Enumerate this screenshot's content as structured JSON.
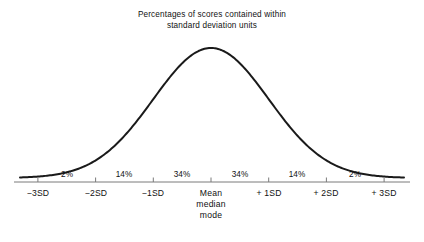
{
  "title": {
    "line1": "Percentages of scores contained within",
    "line2": "standard deviation units"
  },
  "chart_data": {
    "type": "line",
    "title": "Percentages of scores contained within standard deviation units",
    "xlabel": "",
    "ylabel": "",
    "curve": "normal-distribution-bell-curve",
    "grid": false,
    "legend": false,
    "xlim": [
      -3.5,
      3.5
    ],
    "categories": [
      "−3SD",
      "−2SD",
      "−1SD",
      "Mean median mode",
      "+ 1SD",
      "+ 2SD",
      "+ 3SD"
    ],
    "tick_labels": [
      {
        "id": "minus3sd",
        "text": "−3SD",
        "x_sd": -3
      },
      {
        "id": "minus2sd",
        "text": "−2SD",
        "x_sd": -2
      },
      {
        "id": "minus1sd",
        "text": "−1SD",
        "x_sd": -1
      },
      {
        "id": "mean",
        "text": "Mean\nmedian\nmode",
        "x_sd": 0
      },
      {
        "id": "plus1sd",
        "text": "+ 1SD",
        "x_sd": 1
      },
      {
        "id": "plus2sd",
        "text": "+ 2SD",
        "x_sd": 2
      },
      {
        "id": "plus3sd",
        "text": "+ 3SD",
        "x_sd": 3
      }
    ],
    "band_percentages": [
      {
        "range": "−3SD to −2SD",
        "label": "2%",
        "value": 2
      },
      {
        "range": "−2SD to −1SD",
        "label": "14%",
        "value": 14
      },
      {
        "range": "−1SD to Mean",
        "label": "34%",
        "value": 34
      },
      {
        "range": "Mean to + 1SD",
        "label": "34%",
        "value": 34
      },
      {
        "range": "+ 1SD to + 2SD",
        "label": "14%",
        "value": 14
      },
      {
        "range": "+ 2SD to + 3SD",
        "label": "2%",
        "value": 2
      }
    ]
  },
  "center_label": {
    "line1": "Mean",
    "line2": "median",
    "line3": "mode"
  },
  "axis_tick_labels": {
    "minus3sd": "−3SD",
    "minus2sd": "−2SD",
    "minus1sd": "−1SD",
    "plus1sd": "+ 1SD",
    "plus2sd": "+ 2SD",
    "plus3sd": "+ 3SD"
  },
  "percent_labels": {
    "p1": "2%",
    "p2": "14%",
    "p3": "34%",
    "p4": "34%",
    "p5": "14%",
    "p6": "2%"
  },
  "colors": {
    "curve": "#1a1a1a",
    "axis": "#7a7a7a",
    "text": "#111111",
    "background": "#ffffff"
  }
}
